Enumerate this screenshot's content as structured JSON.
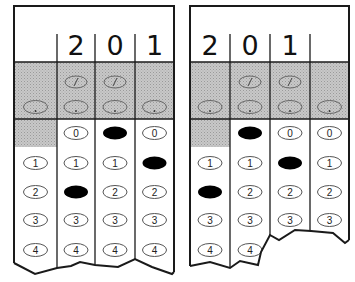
{
  "colors": {
    "ink": "#1a1a1a",
    "shade": "#bdbdbd",
    "fill": "#000000",
    "bubble": "#555555"
  },
  "grids": [
    {
      "name": "left-grid",
      "x": 14,
      "right": 174,
      "cols": [
        14,
        57,
        95,
        135,
        174
      ],
      "written": [
        "",
        "2",
        "0",
        "1"
      ],
      "filled": [
        null,
        2,
        0,
        1
      ],
      "tear": "14,263 35,274 57,268 57,268 71,266 80,262 95,265 118,267 135,259 152,267 172,274 174,272"
    },
    {
      "name": "right-grid",
      "x": 190,
      "right": 349,
      "cols": [
        190,
        230,
        270,
        310,
        349
      ],
      "written": [
        "2",
        "0",
        "1",
        ""
      ],
      "filled": [
        2,
        0,
        1,
        null
      ],
      "tear": "190,266 210,262 230,268 230,268 240,261 258,265 261,252 270,235 279,240 295,230 311,231 333,233 345,243 349,240"
    }
  ],
  "top": 6,
  "header_bottom": 62,
  "shade_bottom": 119,
  "rows": [
    {
      "label": "0",
      "y": 133
    },
    {
      "label": "1",
      "y": 163
    },
    {
      "label": "2",
      "y": 192
    },
    {
      "label": "3",
      "y": 220
    },
    {
      "label": "4",
      "y": 250
    }
  ],
  "slash_row_y": 82,
  "dot_row_y": 107
}
